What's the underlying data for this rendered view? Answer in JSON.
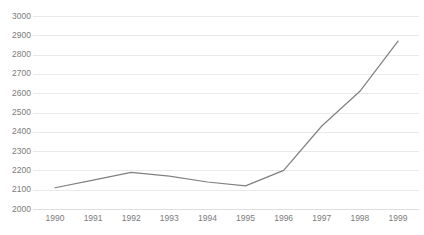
{
  "chart": {
    "title": "",
    "title_clipped_note": ""
  },
  "chart_data": {
    "type": "line",
    "title": "",
    "subtitle": "",
    "xlabel": "",
    "ylabel": "",
    "x": [
      1990,
      1991,
      1992,
      1993,
      1994,
      1995,
      1996,
      1997,
      1998,
      1999
    ],
    "categories": [
      "1990",
      "1991",
      "1992",
      "1993",
      "1994",
      "1995",
      "1996",
      "1997",
      "1998",
      "1999"
    ],
    "values": [
      2110,
      2150,
      2190,
      2170,
      2140,
      2120,
      2200,
      2430,
      2610,
      2870
    ],
    "series": [
      {
        "name": "",
        "color": "#808080",
        "values": [
          2110,
          2150,
          2190,
          2170,
          2140,
          2120,
          2200,
          2430,
          2610,
          2870
        ]
      }
    ],
    "ylim": [
      2000,
      3000
    ],
    "ytick_step": 100,
    "yticks": [
      2000,
      2100,
      2200,
      2300,
      2400,
      2500,
      2600,
      2700,
      2800,
      2900,
      3000
    ],
    "ytick_labels": [
      "2000",
      "2100",
      "2200",
      "2300",
      "2400",
      "2500",
      "2600",
      "2700",
      "2800",
      "2900",
      "3000"
    ],
    "xticks": [
      1990,
      1991,
      1992,
      1993,
      1994,
      1995,
      1996,
      1997,
      1998,
      1999
    ],
    "xtick_labels": [
      "1990",
      "1991",
      "1992",
      "1993",
      "1994",
      "1995",
      "1996",
      "1997",
      "1998",
      "1999"
    ],
    "grid": {
      "horizontal": true,
      "vertical": false,
      "color": "#e9e9ec"
    },
    "legend": {
      "visible": false,
      "position": "none",
      "entries": []
    },
    "markers": false,
    "line_width": 1.2,
    "background": "#ffffff",
    "tick_label_color": "#7b7b7b"
  }
}
